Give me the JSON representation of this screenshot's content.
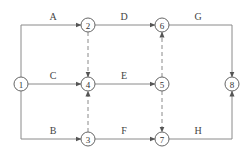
{
  "diagram": {
    "type": "activity-on-arrow network",
    "nodes": [
      {
        "id": "1",
        "label": "1",
        "x": 21,
        "y": 84
      },
      {
        "id": "2",
        "label": "2",
        "x": 88,
        "y": 25
      },
      {
        "id": "3",
        "label": "3",
        "x": 88,
        "y": 139
      },
      {
        "id": "4",
        "label": "4",
        "x": 88,
        "y": 84
      },
      {
        "id": "5",
        "label": "5",
        "x": 162,
        "y": 84
      },
      {
        "id": "6",
        "label": "6",
        "x": 162,
        "y": 25
      },
      {
        "id": "7",
        "label": "7",
        "x": 162,
        "y": 139
      },
      {
        "id": "8",
        "label": "8",
        "x": 232,
        "y": 84
      }
    ],
    "activities": [
      {
        "label": "A",
        "from": "1",
        "to": "2",
        "style": "solid"
      },
      {
        "label": "B",
        "from": "1",
        "to": "3",
        "style": "solid"
      },
      {
        "label": "C",
        "from": "1",
        "to": "4",
        "style": "solid"
      },
      {
        "label": "D",
        "from": "2",
        "to": "6",
        "style": "solid"
      },
      {
        "label": "E",
        "from": "4",
        "to": "5",
        "style": "solid"
      },
      {
        "label": "F",
        "from": "3",
        "to": "7",
        "style": "solid"
      },
      {
        "label": "G",
        "from": "6",
        "to": "8",
        "style": "solid"
      },
      {
        "label": "H",
        "from": "7",
        "to": "8",
        "style": "solid"
      }
    ],
    "dummy_activities": [
      {
        "from": "2",
        "to": "4",
        "style": "dashed"
      },
      {
        "from": "3",
        "to": "4",
        "style": "dashed"
      },
      {
        "from": "5",
        "to": "6",
        "style": "dashed"
      },
      {
        "from": "5",
        "to": "7",
        "style": "dashed"
      }
    ],
    "labels": {
      "A": "A",
      "B": "B",
      "C": "C",
      "D": "D",
      "E": "E",
      "F": "F",
      "G": "G",
      "H": "H",
      "n1": "1",
      "n2": "2",
      "n3": "3",
      "n4": "4",
      "n5": "5",
      "n6": "6",
      "n7": "7",
      "n8": "8"
    }
  }
}
